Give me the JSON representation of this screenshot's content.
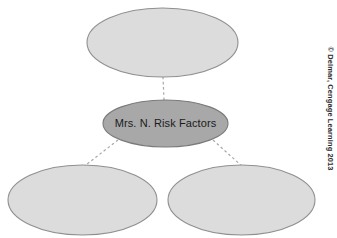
{
  "diagram": {
    "type": "concept-map",
    "title": "",
    "background_color": "#ffffff",
    "nodes": [
      {
        "id": "top",
        "label": "",
        "shape": "ellipse",
        "fill": "#dcdcdc",
        "stroke": "#8c8c8c",
        "cx": 162.5,
        "cy": 42.5,
        "rx": 75.5,
        "ry": 34.5
      },
      {
        "id": "center",
        "label": "Mrs. N. Risk Factors",
        "shape": "ellipse",
        "fill": "#a8a8a8",
        "stroke": "#7d7d7d",
        "cx": 165.5,
        "cy": 123.5,
        "rx": 62.5,
        "ry": 23.5
      },
      {
        "id": "bottom-left",
        "label": "",
        "shape": "ellipse",
        "fill": "#dcdcdc",
        "stroke": "#8c8c8c",
        "cx": 82.5,
        "cy": 200,
        "rx": 74.5,
        "ry": 35
      },
      {
        "id": "bottom-right",
        "label": "",
        "shape": "ellipse",
        "fill": "#dcdcdc",
        "stroke": "#8c8c8c",
        "cx": 241.5,
        "cy": 200,
        "rx": 73.5,
        "ry": 35
      }
    ],
    "connectors": [
      {
        "id": "center-to-top",
        "from": "center",
        "to": "top",
        "style": "dashed",
        "color": "#a0a0a0",
        "x1": 164,
        "y1": 100,
        "x2": 163,
        "y2": 77
      },
      {
        "id": "center-to-bottom-left",
        "from": "center",
        "to": "bottom-left",
        "style": "dashed",
        "color": "#a0a0a0",
        "x1": 118,
        "y1": 140,
        "x2": 83,
        "y2": 167
      },
      {
        "id": "center-to-bottom-right",
        "from": "center",
        "to": "bottom-right",
        "style": "dashed",
        "color": "#a0a0a0",
        "x1": 213,
        "y1": 140,
        "x2": 243,
        "y2": 167
      }
    ]
  },
  "copyright": {
    "text": "© Delmar, Cengage Learning 2013"
  }
}
